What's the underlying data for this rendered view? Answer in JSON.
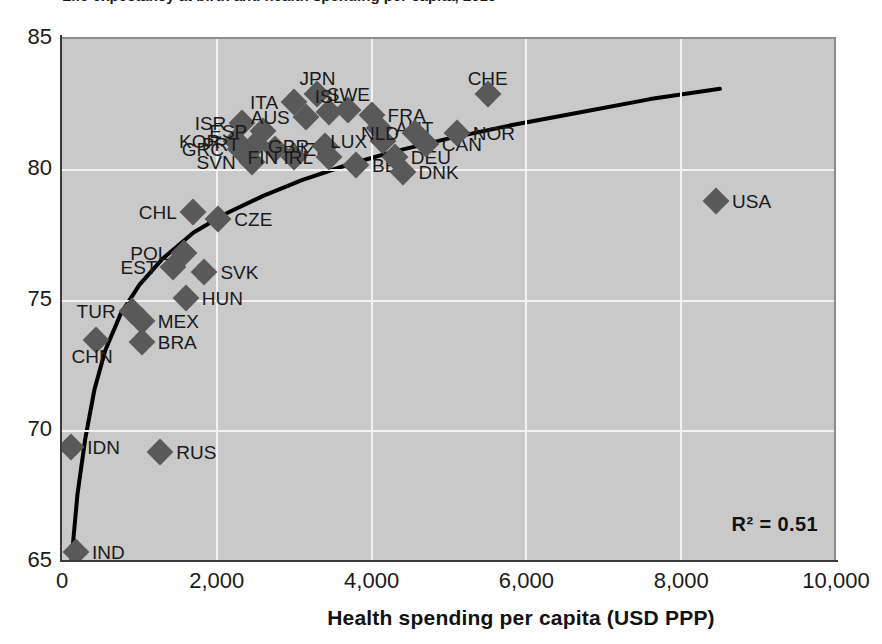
{
  "figure": {
    "cut_off_title": "Life expectancy at birth and health spending per capita, 2019",
    "annotation_r2": "R² = 0.51",
    "xlabel": "Health spending per capita (USD PPP)",
    "ylabel": ""
  },
  "chart_data": {
    "type": "scatter",
    "title": "",
    "xlabel": "Health spending per capita (USD PPP)",
    "ylabel": "",
    "xlim": [
      0,
      10000
    ],
    "ylim": [
      65,
      85
    ],
    "xticks": [
      "0",
      "2,000",
      "4,000",
      "6,000",
      "8,000",
      "10,000"
    ],
    "xtick_values": [
      0,
      2000,
      4000,
      6000,
      8000,
      10000
    ],
    "yticks": [
      "65",
      "70",
      "75",
      "80",
      "85"
    ],
    "ytick_values": [
      65,
      70,
      75,
      80,
      85
    ],
    "grid": true,
    "legend": null,
    "annotations": [
      "R² = 0.51"
    ],
    "marker_shape": "diamond",
    "marker_color": "#595959",
    "trendline": {
      "type": "logarithmic",
      "color": "#000000",
      "r_squared": 0.51,
      "points": [
        [
          120,
          65.0
        ],
        [
          200,
          67.6
        ],
        [
          300,
          69.7
        ],
        [
          420,
          71.6
        ],
        [
          560,
          73.1
        ],
        [
          760,
          74.5
        ],
        [
          1000,
          75.6
        ],
        [
          1300,
          76.6
        ],
        [
          1700,
          77.6
        ],
        [
          2100,
          78.3
        ],
        [
          2600,
          79.0
        ],
        [
          3100,
          79.6
        ],
        [
          3700,
          80.2
        ],
        [
          4300,
          80.7
        ],
        [
          5000,
          81.2
        ],
        [
          5800,
          81.7
        ],
        [
          6700,
          82.2
        ],
        [
          7600,
          82.7
        ],
        [
          8500,
          83.1
        ]
      ]
    },
    "points": [
      {
        "label": "IND",
        "x": 180,
        "y": 65.4,
        "label_pos": "right"
      },
      {
        "label": "IDN",
        "x": 120,
        "y": 69.4,
        "label_pos": "right"
      },
      {
        "label": "RUS",
        "x": 1270,
        "y": 69.2,
        "label_pos": "right"
      },
      {
        "label": "CHN",
        "x": 440,
        "y": 73.5,
        "label_pos": "below-left"
      },
      {
        "label": "BRA",
        "x": 1030,
        "y": 73.4,
        "label_pos": "right"
      },
      {
        "label": "TUR",
        "x": 900,
        "y": 74.6,
        "label_pos": "left"
      },
      {
        "label": "MEX",
        "x": 1030,
        "y": 74.2,
        "label_pos": "right"
      },
      {
        "label": "HUN",
        "x": 1600,
        "y": 75.1,
        "label_pos": "right"
      },
      {
        "label": "EST",
        "x": 1440,
        "y": 76.3,
        "label_pos": "left"
      },
      {
        "label": "SVK",
        "x": 1840,
        "y": 76.1,
        "label_pos": "right"
      },
      {
        "label": "POL",
        "x": 1580,
        "y": 76.8,
        "label_pos": "left"
      },
      {
        "label": "CHL",
        "x": 1690,
        "y": 78.4,
        "label_pos": "left"
      },
      {
        "label": "CZE",
        "x": 2020,
        "y": 78.1,
        "label_pos": "right"
      },
      {
        "label": "SVN",
        "x": 2450,
        "y": 80.3,
        "label_pos": "left"
      },
      {
        "label": "GRC",
        "x": 2300,
        "y": 80.8,
        "label_pos": "left"
      },
      {
        "label": "KOR",
        "x": 2250,
        "y": 81.1,
        "label_pos": "left"
      },
      {
        "label": "ISR",
        "x": 2330,
        "y": 81.8,
        "label_pos": "left"
      },
      {
        "label": "PRT",
        "x": 2500,
        "y": 81.0,
        "label_pos": "left"
      },
      {
        "label": "ESP",
        "x": 2600,
        "y": 81.5,
        "label_pos": "left"
      },
      {
        "label": "NZL",
        "x": 2750,
        "y": 80.8,
        "label_pos": "right"
      },
      {
        "label": "ITA",
        "x": 3000,
        "y": 82.6,
        "label_pos": "left"
      },
      {
        "label": "FIN",
        "x": 3000,
        "y": 80.5,
        "label_pos": "left"
      },
      {
        "label": "AUS",
        "x": 3150,
        "y": 82.0,
        "label_pos": "left"
      },
      {
        "label": "JPN",
        "x": 3300,
        "y": 82.9,
        "label_pos": "above"
      },
      {
        "label": "ISL",
        "x": 3450,
        "y": 82.2,
        "label_pos": "above"
      },
      {
        "label": "GBR",
        "x": 3400,
        "y": 80.9,
        "label_pos": "left"
      },
      {
        "label": "IRL",
        "x": 3450,
        "y": 80.5,
        "label_pos": "left"
      },
      {
        "label": "SWE",
        "x": 3700,
        "y": 82.3,
        "label_pos": "above"
      },
      {
        "label": "BEL",
        "x": 3800,
        "y": 80.2,
        "label_pos": "right"
      },
      {
        "label": "FRA",
        "x": 4000,
        "y": 82.1,
        "label_pos": "right"
      },
      {
        "label": "AUT",
        "x": 4100,
        "y": 81.6,
        "label_pos": "right"
      },
      {
        "label": "LUX",
        "x": 4150,
        "y": 81.1,
        "label_pos": "left"
      },
      {
        "label": "DEU",
        "x": 4300,
        "y": 80.5,
        "label_pos": "right"
      },
      {
        "label": "DNK",
        "x": 4400,
        "y": 79.9,
        "label_pos": "right"
      },
      {
        "label": "NLD",
        "x": 4560,
        "y": 81.4,
        "label_pos": "left"
      },
      {
        "label": "CAN",
        "x": 4700,
        "y": 81.0,
        "label_pos": "right"
      },
      {
        "label": "CHE",
        "x": 5500,
        "y": 82.9,
        "label_pos": "above"
      },
      {
        "label": "NOR",
        "x": 5100,
        "y": 81.4,
        "label_pos": "right"
      },
      {
        "label": "USA",
        "x": 8450,
        "y": 78.8,
        "label_pos": "right"
      }
    ]
  }
}
